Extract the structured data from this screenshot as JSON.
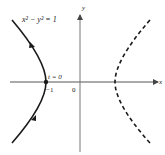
{
  "figure": {
    "equation": "x² − y² = 1",
    "axis_x_label": "x",
    "axis_y_label": "y",
    "origin_label": "0",
    "vertex_label": "−1",
    "param_label": "t = 0",
    "colors": {
      "curve": "#1a1a1a",
      "axis": "#555555",
      "text": "#222222"
    }
  }
}
